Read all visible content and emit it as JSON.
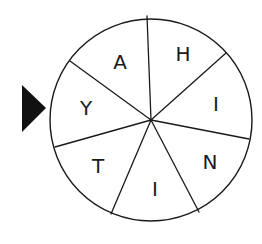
{
  "spinner": {
    "center": [
      151,
      120
    ],
    "radius": 101,
    "stroke_color": "#1a1a1a",
    "background": "#ffffff",
    "pointer": {
      "color": "#111111",
      "points": [
        [
          22,
          85
        ],
        [
          46,
          108
        ],
        [
          22,
          132
        ]
      ],
      "points_to": "Y"
    },
    "spokes": [
      [
        147,
        16
      ],
      [
        226,
        53
      ],
      [
        249,
        139
      ],
      [
        199,
        212
      ],
      [
        111,
        214
      ],
      [
        55,
        147
      ],
      [
        70,
        61
      ]
    ],
    "sections": [
      {
        "letter": "A",
        "x": 120,
        "y": 62
      },
      {
        "letter": "H",
        "x": 183,
        "y": 54
      },
      {
        "letter": "I",
        "x": 216,
        "y": 104
      },
      {
        "letter": "N",
        "x": 210,
        "y": 162
      },
      {
        "letter": "I",
        "x": 155,
        "y": 189
      },
      {
        "letter": "T",
        "x": 98,
        "y": 166
      },
      {
        "letter": "Y",
        "x": 86,
        "y": 108
      }
    ]
  }
}
